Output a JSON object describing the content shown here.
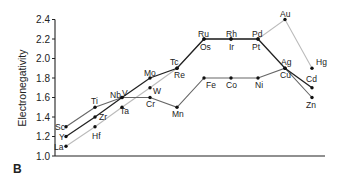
{
  "panel_label": "B",
  "chart_data": {
    "type": "line",
    "title": "",
    "xlabel": "",
    "ylabel": "Electronegativity",
    "ylim": [
      1.0,
      2.4
    ],
    "yticks": [
      1.0,
      1.2,
      1.4,
      1.6,
      1.8,
      2.0,
      2.2,
      2.4
    ],
    "ytick_labels": [
      "1.0",
      "1.2",
      "1.4",
      "1.6",
      "1.8",
      "2.0",
      "2.2",
      "2.4"
    ],
    "grid": false,
    "legend": null,
    "x_positions": [
      0,
      1,
      2,
      3,
      4,
      5,
      6,
      7,
      8,
      9
    ],
    "series": [
      {
        "name": "3d",
        "color": "#666666",
        "labels": [
          "Sc",
          "Ti",
          "V",
          "Cr",
          "Mn",
          "Fe",
          "Co",
          "Ni",
          "Cu",
          "Zn"
        ],
        "values": [
          1.3,
          1.5,
          1.6,
          1.6,
          1.5,
          1.8,
          1.8,
          1.8,
          1.9,
          1.6
        ]
      },
      {
        "name": "4d",
        "color": "#222222",
        "labels": [
          "Y",
          "Zr",
          "Nb",
          "Mo",
          "Tc",
          "Ru",
          "Rh",
          "Pd",
          "Ag",
          "Cd"
        ],
        "values": [
          1.2,
          1.4,
          1.6,
          1.8,
          1.9,
          2.2,
          2.2,
          2.2,
          1.9,
          1.7
        ]
      },
      {
        "name": "5d",
        "color": "#bbbbbb",
        "labels": [
          "La",
          "Hf",
          "Ta",
          "W",
          "Re",
          "Os",
          "Ir",
          "Pt",
          "Au",
          "Hg"
        ],
        "values": [
          1.1,
          1.3,
          1.5,
          1.7,
          1.9,
          2.2,
          2.2,
          2.2,
          2.4,
          1.9
        ]
      }
    ],
    "point_labels": [
      {
        "text": "Sc",
        "x": 55,
        "y": 130
      },
      {
        "text": "Y",
        "x": 59,
        "y": 140
      },
      {
        "text": "La",
        "x": 54,
        "y": 150
      },
      {
        "text": "Ti",
        "x": 91,
        "y": 104
      },
      {
        "text": "Zr",
        "x": 99,
        "y": 120
      },
      {
        "text": "Hf",
        "x": 92,
        "y": 139
      },
      {
        "text": "Nb",
        "x": 110,
        "y": 98
      },
      {
        "text": "V",
        "x": 122,
        "y": 96
      },
      {
        "text": "Ta",
        "x": 120,
        "y": 114
      },
      {
        "text": "Mo",
        "x": 144,
        "y": 76
      },
      {
        "text": "W",
        "x": 153,
        "y": 94
      },
      {
        "text": "Cr",
        "x": 146,
        "y": 107
      },
      {
        "text": "Tc",
        "x": 170,
        "y": 65
      },
      {
        "text": "Re",
        "x": 174,
        "y": 78
      },
      {
        "text": "Mn",
        "x": 172,
        "y": 117
      },
      {
        "text": "Ru",
        "x": 198,
        "y": 37
      },
      {
        "text": "Os",
        "x": 200,
        "y": 50
      },
      {
        "text": "Fe",
        "x": 206,
        "y": 88
      },
      {
        "text": "Rh",
        "x": 226,
        "y": 37
      },
      {
        "text": "Ir",
        "x": 229,
        "y": 50
      },
      {
        "text": "Co",
        "x": 226,
        "y": 88
      },
      {
        "text": "Pd",
        "x": 252,
        "y": 37
      },
      {
        "text": "Pt",
        "x": 252,
        "y": 50
      },
      {
        "text": "Ni",
        "x": 255,
        "y": 88
      },
      {
        "text": "Au",
        "x": 280,
        "y": 17
      },
      {
        "text": "Ag",
        "x": 281,
        "y": 65
      },
      {
        "text": "Cu",
        "x": 280,
        "y": 78
      },
      {
        "text": "Hg",
        "x": 316,
        "y": 65
      },
      {
        "text": "Cd",
        "x": 306,
        "y": 82
      },
      {
        "text": "Zn",
        "x": 306,
        "y": 108
      }
    ]
  }
}
